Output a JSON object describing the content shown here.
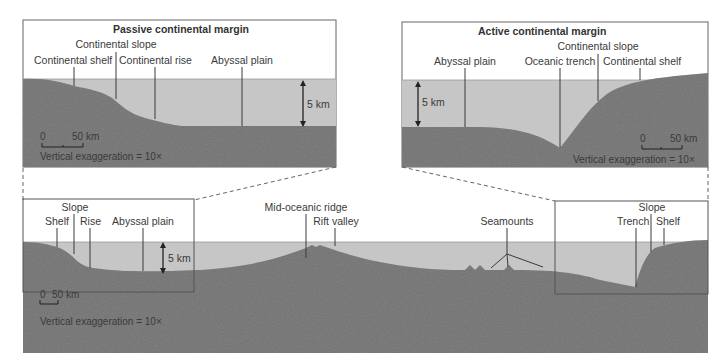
{
  "passive_inset": {
    "title": "Passive continental margin",
    "labels": {
      "shelf": "Continental shelf",
      "slope": "Continental slope",
      "rise": "Continental rise",
      "abyssal": "Abyssal plain"
    },
    "depth_label": "5 km",
    "scale": {
      "zero": "0",
      "fifty": "50 km"
    },
    "exaggeration": "Vertical exaggeration = 10×"
  },
  "active_inset": {
    "title": "Active continental margin",
    "labels": {
      "abyssal": "Abyssal plain",
      "trench": "Oceanic trench",
      "slope": "Continental slope",
      "shelf": "Continental shelf"
    },
    "depth_label": "5 km",
    "scale": {
      "zero": "0",
      "fifty": "50 km"
    },
    "exaggeration": "Vertical exaggeration = 10×"
  },
  "main_profile": {
    "labels": {
      "slope": "Slope",
      "shelf": "Shelf",
      "rise": "Rise",
      "abyssal": "Abyssal plain",
      "ridge": "Mid-oceanic ridge",
      "rift": "Rift valley",
      "seamounts": "Seamounts",
      "right_slope": "Slope",
      "trench": "Trench",
      "right_shelf": "Shelf"
    },
    "depth_label": "5 km",
    "scale": {
      "zero": "0",
      "fifty": "50 km"
    },
    "exaggeration": "Vertical exaggeration = 10×"
  },
  "colors": {
    "rock": "#6f6f6f",
    "water": "#c4c4c4",
    "frame": "#555555",
    "text": "#3a3a3a"
  }
}
